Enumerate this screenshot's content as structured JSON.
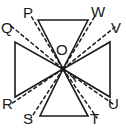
{
  "figure": {
    "stroke_color": "#1b1b1b",
    "background_color": "#ffffff",
    "center_point": {
      "label": "O",
      "x": 63,
      "y": 69
    },
    "vertex_labels": [
      {
        "id": "P",
        "text": "P",
        "x": 23,
        "y": 5
      },
      {
        "id": "Q",
        "text": "Q",
        "x": 1,
        "y": 20
      },
      {
        "id": "W",
        "text": "W",
        "x": 91,
        "y": 4
      },
      {
        "id": "V",
        "text": "V",
        "x": 111,
        "y": 20
      },
      {
        "id": "O",
        "text": "O",
        "x": 56,
        "y": 42
      },
      {
        "id": "R",
        "text": "R",
        "x": 2,
        "y": 96
      },
      {
        "id": "S",
        "text": "S",
        "x": 23,
        "y": 111
      },
      {
        "id": "T",
        "text": "T",
        "x": 90,
        "y": 111
      },
      {
        "id": "U",
        "text": "U",
        "x": 108,
        "y": 96
      }
    ],
    "triangles": [
      {
        "name": "top-triangle",
        "points": "38,20 88,20 63,69"
      },
      {
        "name": "bottom-triangle",
        "points": "40,116 88,116 63,69"
      },
      {
        "name": "left-triangle",
        "points": "15,42 15,97 63,69"
      },
      {
        "name": "right-triangle",
        "points": "110,42 110,97 63,69"
      }
    ],
    "dashed_rays": [
      {
        "name": "ray-OP",
        "from_label": "O",
        "to_label": "P",
        "x1": 63,
        "y1": 69,
        "x2": 31,
        "y2": 16
      },
      {
        "name": "ray-OQ",
        "from_label": "O",
        "to_label": "Q",
        "x1": 63,
        "y1": 69,
        "x2": 11,
        "y2": 26
      },
      {
        "name": "ray-OW",
        "from_label": "O",
        "to_label": "W",
        "x1": 63,
        "y1": 69,
        "x2": 95,
        "y2": 16
      },
      {
        "name": "ray-OV",
        "from_label": "O",
        "to_label": "V",
        "x1": 63,
        "y1": 69,
        "x2": 115,
        "y2": 27
      },
      {
        "name": "ray-OR",
        "from_label": "O",
        "to_label": "R",
        "x1": 63,
        "y1": 69,
        "x2": 11,
        "y2": 104
      },
      {
        "name": "ray-OS",
        "from_label": "O",
        "to_label": "S",
        "x1": 63,
        "y1": 69,
        "x2": 31,
        "y2": 118
      },
      {
        "name": "ray-OT",
        "from_label": "O",
        "to_label": "T",
        "x1": 63,
        "y1": 69,
        "x2": 97,
        "y2": 118
      },
      {
        "name": "ray-OU",
        "from_label": "O",
        "to_label": "U",
        "x1": 63,
        "y1": 69,
        "x2": 113,
        "y2": 104
      }
    ],
    "angle_marker": {
      "name": "angle-arc-at-O",
      "description": "small arc marking the angle between ray OT and the edge toward T"
    }
  }
}
